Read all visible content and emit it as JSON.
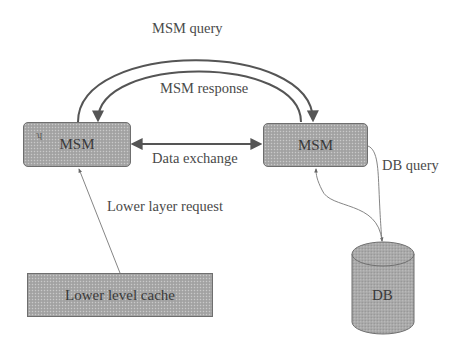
{
  "diagram": {
    "nodes": {
      "msm_left": {
        "label": "MSM"
      },
      "msm_right": {
        "label": "MSM"
      },
      "lower_cache": {
        "label": "Lower level cache"
      },
      "db": {
        "label": "DB"
      }
    },
    "edges": {
      "msm_query": {
        "label": "MSM query",
        "from": "msm_left",
        "to": "msm_right"
      },
      "msm_response": {
        "label": "MSM response",
        "from": "msm_right",
        "to": "msm_left"
      },
      "data_exchange": {
        "label": "Data exchange",
        "from": "msm_left",
        "to": "msm_right",
        "bidirectional": true
      },
      "lower_layer_request": {
        "label": "Lower layer request",
        "from": "lower_cache",
        "to": "msm_left"
      },
      "db_query": {
        "label": "DB query",
        "from": "msm_right",
        "to": "db"
      },
      "db_response": {
        "label": "",
        "from": "db",
        "to": "msm_right"
      }
    },
    "colors": {
      "node_fill": "#a9a9a9",
      "stroke": "#555555",
      "text": "#4a4a4a"
    }
  }
}
